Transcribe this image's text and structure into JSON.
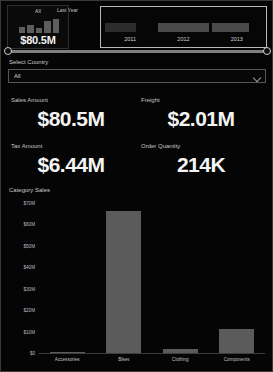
{
  "kpi_card": {
    "title": "All",
    "value": "$80.5M",
    "spark_values": [
      38,
      52,
      30,
      72,
      88
    ]
  },
  "last_year_label": "Last Year",
  "timeline": {
    "years": [
      "2011",
      "2012",
      "2013"
    ],
    "bar_fills": [
      62,
      100,
      74
    ],
    "handle_left_name": "range-handle-left",
    "handle_right_name": "range-handle-right"
  },
  "country": {
    "label": "Select Country",
    "selected": "All"
  },
  "kpis": [
    {
      "label": "Sales Amount",
      "value": "$80.5M"
    },
    {
      "label": "Freight",
      "value": "$2.01M"
    },
    {
      "label": "Tax Amount",
      "value": "$6.44M"
    },
    {
      "label": "Order Quantity",
      "value": "214K"
    }
  ],
  "chart_data": {
    "type": "bar",
    "title": "Category Sales",
    "categories": [
      "Accessories",
      "Bikes",
      "Clothing",
      "Components"
    ],
    "values": [
      0.7,
      66.3,
      2.1,
      11.2
    ],
    "xlabel": "",
    "ylabel": "",
    "ylim": [
      0,
      70
    ],
    "yticks": [
      "$0",
      "$10M",
      "$20M",
      "$30M",
      "$40M",
      "$50M",
      "$60M",
      "$70M"
    ],
    "ytick_values": [
      0,
      10,
      20,
      30,
      40,
      50,
      60,
      70
    ],
    "grid": false,
    "legend": "none",
    "bar_color": "#5b5b5b"
  }
}
